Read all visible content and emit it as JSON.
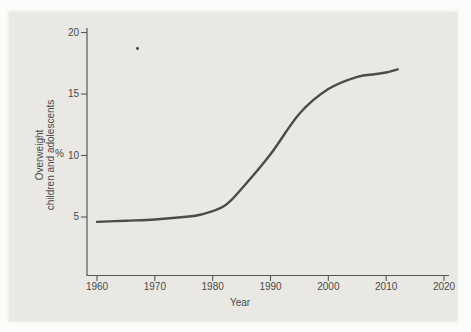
{
  "figure": {
    "page_background": "#fcfcfa",
    "panel_background": "#e9e8e4",
    "axis_color": "#565654",
    "text_color": "#4a4a48"
  },
  "chart_data": {
    "type": "line",
    "title": "",
    "xlabel": "Year",
    "ylabel_line1": "Overweight",
    "ylabel_line2": "children and adolescents",
    "y_unit": "%",
    "x_ticks": [
      "1960",
      "1970",
      "1980",
      "1990",
      "2000",
      "2010",
      "2020"
    ],
    "y_ticks": [
      "20",
      "15",
      "10",
      "5"
    ],
    "xlim": [
      1958,
      2021
    ],
    "ylim": [
      0,
      20.5
    ],
    "grid": false,
    "legend": "none",
    "line_color": "#4b4b49",
    "series": [
      {
        "name": "Overweight children and adolescents (%)",
        "points": [
          [
            1960,
            4.6
          ],
          [
            1965,
            4.7
          ],
          [
            1970,
            4.8
          ],
          [
            1975,
            5.0
          ],
          [
            1978,
            5.2
          ],
          [
            1982,
            5.9
          ],
          [
            1985,
            7.3
          ],
          [
            1990,
            10.1
          ],
          [
            1995,
            13.4
          ],
          [
            2000,
            15.4
          ],
          [
            2005,
            16.4
          ],
          [
            2008,
            16.6
          ],
          [
            2010,
            16.75
          ],
          [
            2012,
            17.0
          ]
        ]
      }
    ],
    "artifact_dot": {
      "year": 1967,
      "value": 18.7
    }
  }
}
